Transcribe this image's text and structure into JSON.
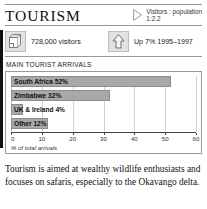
{
  "panel": {
    "title": "TOURISM",
    "ratio_label": "Visitors : population",
    "ratio_value": "1:2.2",
    "ratio_icon": "triangle-right-icon"
  },
  "stats": [
    {
      "icon": "suitcase-icon",
      "text": "728,000 visitors"
    },
    {
      "icon": "up-arrow-icon",
      "text": "Up 7% 1995–1997"
    }
  ],
  "chart_heading": "MAIN TOURIST ARRIVALS",
  "chart_data": {
    "type": "bar",
    "orientation": "horizontal",
    "title": "MAIN TOURIST ARRIVALS",
    "categories": [
      "South Africa",
      "Zimbabwe",
      "UK & Ireland",
      "Other"
    ],
    "values": [
      52,
      32,
      4,
      12
    ],
    "bar_labels": [
      "South Africa  52%",
      "Zimbabwe  32%",
      "UK & Ireland  4%",
      "Other 12%"
    ],
    "xlabel": "% of total arrivals",
    "ylabel": "",
    "xlim": [
      0,
      60
    ],
    "xticks": [
      0,
      10,
      20,
      30,
      40,
      50,
      60
    ],
    "xtick_labels": [
      "0",
      "10",
      "20",
      "30",
      "40",
      "50",
      "60"
    ],
    "grid": true,
    "legend": null,
    "bar_color": "#a8a8a8",
    "bar_border_color": "#8d8d8d"
  },
  "body_text": "Tourism is aimed at wealthy wildlife enthusiasts and focuses on safaris, especially to the Okavango delta.",
  "colors": {
    "rule": "#9a9a9a",
    "bar": "#a8a8a8",
    "text": "#111111",
    "gridline": "#d2d2d2",
    "left_bleed": "#111111"
  }
}
